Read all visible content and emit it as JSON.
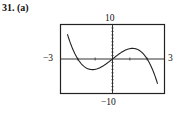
{
  "problem_label": "31. (a)",
  "chart_data": {
    "type": "line",
    "title": "",
    "function": "f(x) = -x^3 + 4x",
    "xlabel": "",
    "ylabel": "",
    "xlim": [
      -3,
      3
    ],
    "ylim": [
      -10,
      10
    ],
    "x_tick_step": 1,
    "y_tick_step": 1,
    "grid": false,
    "window_labels": {
      "xmin": "−3",
      "xmax": "3",
      "ymin": "−10",
      "ymax": "10"
    },
    "x": [
      -2.6,
      -2.0,
      -1.5,
      -1.155,
      -0.5,
      0,
      0.5,
      1.155,
      1.5,
      2.0,
      2.6
    ],
    "values": [
      10,
      0,
      -2.6,
      -3.08,
      -1.9,
      0,
      1.9,
      3.08,
      2.6,
      0,
      -10
    ],
    "color": "#222222"
  }
}
